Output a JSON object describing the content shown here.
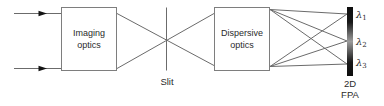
{
  "colors": {
    "background": "#ffffff",
    "ray_line": "#6b6b6b",
    "box_border": "#7e7e7e",
    "text": "#2b2b2b",
    "arrowhead": "#141414",
    "detector_bar_dark": "#0e0e0e",
    "detector_bar_mid": "#9b9b9b"
  },
  "diagram": {
    "input_arrows": 2,
    "imaging_box": {
      "label": "Imaging\noptics"
    },
    "dispersive_box": {
      "label": "Dispersive\noptics"
    },
    "slit": {
      "label": "Slit"
    },
    "detector": {
      "label": "2D\nFPA",
      "wavelengths": [
        {
          "symbol": "λ",
          "sub": "1"
        },
        {
          "symbol": "λ",
          "sub": "2"
        },
        {
          "symbol": "λ",
          "sub": "3"
        }
      ]
    }
  }
}
